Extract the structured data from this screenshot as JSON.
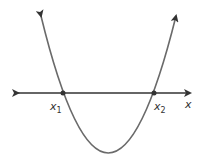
{
  "diagram": {
    "type": "parabola-roots",
    "axis_label": "x",
    "roots": [
      {
        "label": "x",
        "subscript": "1"
      },
      {
        "label": "x",
        "subscript": "2"
      }
    ],
    "colors": {
      "curve": "#6a6a6a",
      "axis": "#333333",
      "point": "#333333"
    }
  }
}
